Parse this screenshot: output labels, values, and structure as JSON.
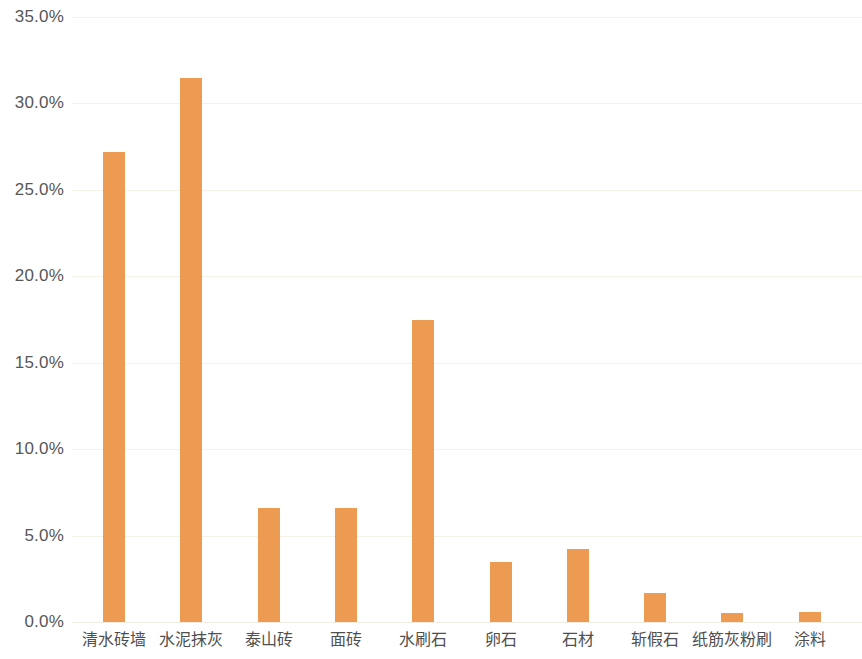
{
  "chart_data": {
    "type": "bar",
    "title": "",
    "subtitle": "",
    "xlabel": "",
    "ylabel": "",
    "categories": [
      "清水砖墙",
      "水泥抹灰",
      "泰山砖",
      "面砖",
      "水刷石",
      "卵石",
      "石材",
      "斩假石",
      "纸筋灰粉刷",
      "涂料"
    ],
    "values": [
      27.2,
      31.5,
      6.6,
      6.6,
      17.5,
      3.5,
      4.2,
      1.7,
      0.5,
      0.6
    ],
    "value_labels": [
      "27.2%",
      "31.5%",
      "6.6%",
      "6.6%",
      "17.5%",
      "3.5%",
      "4.2%",
      "1.7%",
      "0.5%",
      "0.6%"
    ],
    "ylim": [
      0,
      35
    ],
    "yticks": [
      0,
      5,
      10,
      15,
      20,
      25,
      30,
      35
    ],
    "ytick_labels": [
      "0.0%",
      "5.0%",
      "10.0%",
      "15.0%",
      "20.0%",
      "25.0%",
      "30.0%",
      "35.0%"
    ],
    "grid": true,
    "grid_axis": "y",
    "legend": false,
    "legend_position": "none",
    "data_labels_shown": false,
    "bar_color": "#ed9b52",
    "gridline_color": "#f6f1e6",
    "axis_label_color": "#575757",
    "background_color": "#ffffff"
  }
}
